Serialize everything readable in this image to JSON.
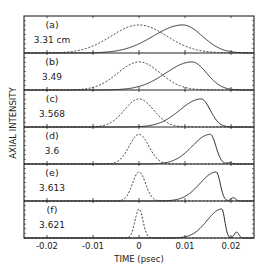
{
  "chart_data": {
    "type": "line",
    "title": "",
    "xlabel": "TIME (psec)",
    "ylabel": "AXIAL INTENSITY",
    "xlim": [
      -0.025,
      0.025
    ],
    "xticks": [
      -0.02,
      -0.01,
      0,
      0.01,
      0.02
    ],
    "xtick_labels": [
      "-0.02",
      "-0.01",
      "0",
      "0.01",
      "0.02"
    ],
    "grid": false,
    "legend": "none",
    "line_styles": {
      "input_pulse": "dashed",
      "output_pulse": "solid"
    },
    "panels": [
      {
        "letter": "(a)",
        "value": "3.31 cm",
        "dashed": {
          "center": 0.0,
          "width": 0.0085,
          "peak": 0.85
        },
        "solid": {
          "peak_time": 0.0095,
          "rise": 0.009,
          "fall": 0.006,
          "peak": 0.85,
          "satellite": null
        }
      },
      {
        "letter": "(b)",
        "value": "3.49",
        "dashed": {
          "center": 0.0,
          "width": 0.0065,
          "peak": 0.85
        },
        "solid": {
          "peak_time": 0.0115,
          "rise": 0.008,
          "fall": 0.0045,
          "peak": 0.85,
          "satellite": null
        }
      },
      {
        "letter": "(c)",
        "value": "3.568",
        "dashed": {
          "center": 0.0,
          "width": 0.0045,
          "peak": 0.85
        },
        "solid": {
          "peak_time": 0.0135,
          "rise": 0.0065,
          "fall": 0.0028,
          "peak": 0.85,
          "satellite": null
        }
      },
      {
        "letter": "(d)",
        "value": "3.6",
        "dashed": {
          "center": 0.0,
          "width": 0.003,
          "peak": 0.9
        },
        "solid": {
          "peak_time": 0.0155,
          "rise": 0.0055,
          "fall": 0.0017,
          "peak": 0.9,
          "satellite": {
            "t": 0.0197,
            "h": 0.04
          }
        }
      },
      {
        "letter": "(e)",
        "value": "3.613",
        "dashed": {
          "center": 0.0,
          "width": 0.002,
          "peak": 0.88
        },
        "solid": {
          "peak_time": 0.0168,
          "rise": 0.005,
          "fall": 0.0012,
          "peak": 0.88,
          "satellite": {
            "t": 0.0205,
            "h": 0.1
          }
        }
      },
      {
        "letter": "(f)",
        "value": "3.621",
        "dashed": {
          "center": 0.0,
          "width": 0.0012,
          "peak": 0.88
        },
        "solid": {
          "peak_time": 0.018,
          "rise": 0.0045,
          "fall": 0.0009,
          "peak": 0.88,
          "satellite": {
            "t": 0.0212,
            "h": 0.18
          }
        }
      }
    ]
  },
  "labels": {
    "xlabel": "TIME (psec)",
    "ylabel": "AXIAL INTENSITY",
    "xticks": [
      "-0.02",
      "-0.01",
      "0",
      "0.01",
      "0.02"
    ],
    "panels": [
      {
        "letter": "(a)",
        "value": "3.31 cm"
      },
      {
        "letter": "(b)",
        "value": "3.49"
      },
      {
        "letter": "(c)",
        "value": "3.568"
      },
      {
        "letter": "(d)",
        "value": "3.6"
      },
      {
        "letter": "(e)",
        "value": "3.613"
      },
      {
        "letter": "(f)",
        "value": "3.621"
      }
    ]
  },
  "colors": {
    "line": "#2a2a2a",
    "frame": "#222222",
    "background": "#ffffff"
  }
}
